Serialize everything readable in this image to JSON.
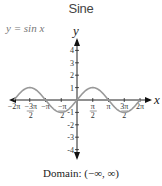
{
  "title": "Sine",
  "equation": "y = sin x",
  "domain_text": "Domain: (−∞, ∞)",
  "chart_data": {
    "type": "line",
    "title": "Sine",
    "function": "y = sin x",
    "xlabel": "x",
    "ylabel": "y",
    "x_range": [
      -6.2832,
      6.2832
    ],
    "ylim": [
      -4.5,
      4.5
    ],
    "x_tick_labels": [
      "-2π",
      "-3π/2",
      "-π",
      "-π/2",
      "π/2",
      "π",
      "3π/2",
      "2π"
    ],
    "x_tick_values": [
      -6.2832,
      -4.7124,
      -3.1416,
      -1.5708,
      1.5708,
      3.1416,
      4.7124,
      6.2832
    ],
    "y_tick_labels": [
      "4",
      "3",
      "2",
      "1",
      "-1",
      "-2",
      "-3",
      "-4"
    ],
    "y_tick_values": [
      4,
      3,
      2,
      1,
      -1,
      -2,
      -3,
      -4
    ],
    "series": [
      {
        "name": "sin x",
        "x": [
          -6.2832,
          -4.7124,
          -3.1416,
          -1.5708,
          0,
          1.5708,
          3.1416,
          4.7124,
          6.2832
        ],
        "values": [
          0,
          1,
          0,
          -1,
          0,
          1,
          0,
          -1,
          0
        ],
        "color": "#999999"
      }
    ],
    "grid": false,
    "annotation": "Domain: (−∞, ∞)"
  }
}
